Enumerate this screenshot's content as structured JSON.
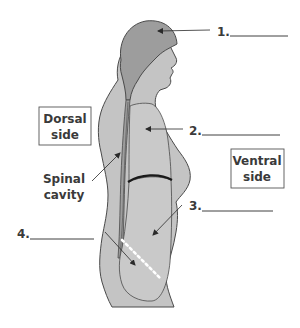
{
  "diagram": {
    "type": "anatomical-body-cavities-side-view",
    "colors": {
      "head_fill": "#9d9d9d",
      "body_fill": "#c4c4c4",
      "cavity_fill": "#c9c9c9",
      "outline": "#4a4a4a",
      "text": "#3a3a3a",
      "diaphragm": "#1a1a1a",
      "dotted_line": "#ffffff"
    },
    "labels": [
      {
        "id": "1",
        "text": "1.",
        "blank": "________"
      },
      {
        "id": "2",
        "text": "2.",
        "blank": "________"
      },
      {
        "id": "3",
        "text": "3.",
        "blank": "________"
      },
      {
        "id": "4",
        "text": "4.",
        "blank": "________"
      }
    ],
    "boxes": {
      "dorsal": {
        "line1": "Dorsal",
        "line2": "side"
      },
      "ventral": {
        "line1": "Ventral",
        "line2": "side"
      }
    },
    "annotations": {
      "spinal_cavity": {
        "line1": "Spinal",
        "line2": "cavity"
      }
    }
  }
}
